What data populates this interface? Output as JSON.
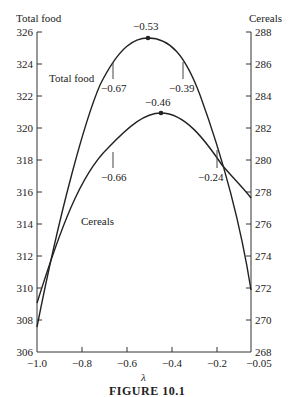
{
  "figure": {
    "caption": "FIGURE 10.1"
  },
  "chart_data": {
    "type": "line",
    "title": "",
    "xlabel": "λ",
    "ylabel_left": "Total food",
    "ylabel_right": "Cereals",
    "xlim": [
      -1.0,
      -0.05
    ],
    "ylim_left": [
      306,
      326
    ],
    "ylim_right": [
      268,
      288
    ],
    "x_ticks": [
      "−1.0",
      "−0.8",
      "−0.6",
      "−0.4",
      "−0.2",
      "−0.05"
    ],
    "y_ticks_left": [
      "306",
      "308",
      "310",
      "312",
      "314",
      "316",
      "318",
      "320",
      "322",
      "324",
      "326"
    ],
    "y_ticks_right": [
      "268",
      "270",
      "272",
      "274",
      "276",
      "278",
      "280",
      "282",
      "284",
      "286",
      "288"
    ],
    "grid": false,
    "series": [
      {
        "name": "Total food",
        "axis": "left",
        "x": [
          -1.0,
          -0.9,
          -0.8,
          -0.67,
          -0.6,
          -0.53,
          -0.45,
          -0.39,
          -0.3,
          -0.2,
          -0.1,
          -0.05
        ],
        "values": [
          307.5,
          313.5,
          319.5,
          324.0,
          325.2,
          325.6,
          325.2,
          324.0,
          321.0,
          316.5,
          312.0,
          310.0
        ],
        "max_point": {
          "x": -0.53,
          "label": "−0.53"
        },
        "markers": [
          {
            "x": -0.67,
            "label": "−0.67"
          },
          {
            "x": -0.39,
            "label": "−0.39"
          }
        ]
      },
      {
        "name": "Cereals",
        "axis": "right",
        "x": [
          -1.0,
          -0.9,
          -0.8,
          -0.66,
          -0.55,
          -0.46,
          -0.35,
          -0.24,
          -0.15,
          -0.05
        ],
        "values": [
          270.8,
          274.5,
          278.0,
          280.5,
          282.2,
          282.8,
          282.1,
          280.0,
          278.3,
          277.5
        ],
        "max_point": {
          "x": -0.46,
          "label": "−0.46"
        },
        "markers": [
          {
            "x": -0.66,
            "label": "−0.66"
          },
          {
            "x": -0.24,
            "label": "−0.24"
          }
        ]
      }
    ],
    "annotations": [
      "−0.53",
      "−0.67",
      "−0.39",
      "−0.46",
      "−0.66",
      "−0.24",
      "Total food",
      "Cereals"
    ]
  }
}
